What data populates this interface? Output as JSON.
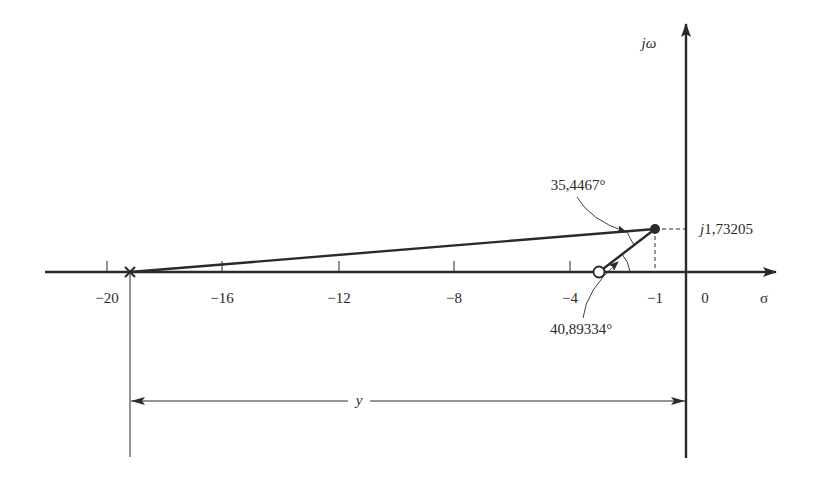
{
  "diagram": {
    "type": "s-plane angle diagram",
    "axes": {
      "real_axis_label": "σ",
      "imag_axis_label": "jω",
      "origin_label": "0",
      "ticks": [
        {
          "value": -20,
          "label": "−20"
        },
        {
          "value": -16,
          "label": "−16"
        },
        {
          "value": -12,
          "label": "−12"
        },
        {
          "value": -8,
          "label": "−8"
        },
        {
          "value": -4,
          "label": "−4"
        },
        {
          "value": -1,
          "label": "−1"
        }
      ]
    },
    "points": {
      "pole": {
        "symbol": "×",
        "sigma": -19.4
      },
      "zero": {
        "symbol": "o",
        "sigma": -3
      },
      "test_point": {
        "symbol": "●",
        "sigma": -1,
        "omega": 1.73205,
        "imag_label": "j1,73205"
      }
    },
    "angles": {
      "pole_angle_label": "35,4467°",
      "zero_angle_label": "40,89334°"
    },
    "dimension": {
      "label": "y"
    },
    "colors": {
      "ink": "#2a2a2a",
      "background": "#ffffff"
    }
  }
}
